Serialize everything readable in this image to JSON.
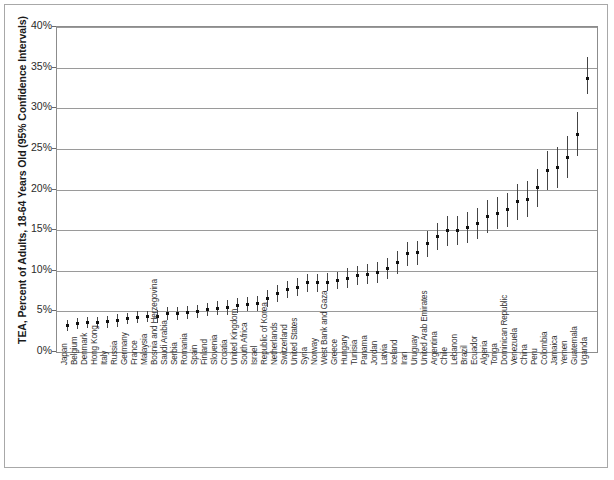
{
  "figure": {
    "axis_title_y": "TEA, Percent of Adults, 18-64 Years Old (95% Confidence Intervals)",
    "frame_color": "#a8a8a8",
    "plot_border_color": "#8c8c8c",
    "grid_color": "#9a9a9a",
    "marker_color": "#111111",
    "ci_color": "#454545"
  },
  "chart_data": {
    "type": "scatter",
    "title": "",
    "subtitle": "",
    "xlabel": "",
    "ylabel": "TEA, Percent of Adults, 18-64 Years Old (95% Confidence Intervals)",
    "ylim": [
      0,
      40
    ],
    "ytick_labels": [
      "0%",
      "5%",
      "10%",
      "15%",
      "20%",
      "25%",
      "30%",
      "35%",
      "40%"
    ],
    "ytick_values": [
      0,
      5,
      10,
      15,
      20,
      25,
      30,
      35,
      40
    ],
    "grid": "horizontal",
    "legend": "none",
    "error_bars": "95% confidence intervals",
    "categories": [
      "Japan",
      "Belgium",
      "Denmark",
      "Hong Kong",
      "Italy",
      "Russia",
      "Germany",
      "France",
      "Malaysia",
      "Bosnia and Herzegovina",
      "Saudi Arabia",
      "Serbia",
      "Romania",
      "Spain",
      "Finland",
      "Slovenia",
      "Croatia",
      "United Kingdom",
      "South Africa",
      "Israel",
      "Republic of Korea",
      "Netherlands",
      "Switzerland",
      "United States",
      "Syria",
      "Norway",
      "West Bank and Gaza",
      "Greece",
      "Hungary",
      "Tunisia",
      "Panama",
      "Jordan",
      "Latvia",
      "Iceland",
      "Iran",
      "Uruguay",
      "United Arab Emirates",
      "Argentina",
      "Chile",
      "Lebanon",
      "Brazil",
      "Ecuador",
      "Algeria",
      "Tonga",
      "Dominican Republic",
      "Venezuela",
      "China",
      "Peru",
      "Colombia",
      "Jamaica",
      "Yemen",
      "Guatemala",
      "Uganda"
    ],
    "values": [
      3.3,
      3.5,
      3.6,
      3.6,
      3.7,
      3.9,
      4.1,
      4.3,
      4.4,
      4.4,
      4.7,
      4.8,
      4.9,
      5.0,
      5.2,
      5.4,
      5.5,
      5.7,
      5.9,
      6.0,
      6.6,
      7.2,
      7.7,
      8.0,
      8.5,
      8.5,
      8.6,
      8.8,
      9.1,
      9.4,
      9.6,
      9.8,
      10.3,
      11.0,
      12.1,
      12.2,
      13.3,
      14.2,
      14.9,
      15.0,
      15.3,
      15.8,
      16.7,
      17.1,
      17.5,
      18.5,
      18.8,
      20.2,
      22.4,
      22.7,
      24.0,
      26.8,
      33.7
    ],
    "ci_lower": [
      2.6,
      2.8,
      2.9,
      2.9,
      3.0,
      3.1,
      3.4,
      3.6,
      3.7,
      3.6,
      3.9,
      4.0,
      4.1,
      4.2,
      4.4,
      4.5,
      4.6,
      4.8,
      5.0,
      5.1,
      5.6,
      6.2,
      6.7,
      6.9,
      7.4,
      7.4,
      7.5,
      7.7,
      7.9,
      8.2,
      8.4,
      8.5,
      9.0,
      9.6,
      10.6,
      10.7,
      11.7,
      12.5,
      13.1,
      13.2,
      13.4,
      13.9,
      14.7,
      15.1,
      15.4,
      16.3,
      16.6,
      17.9,
      20.0,
      20.2,
      21.4,
      24.1,
      31.8
    ],
    "ci_upper": [
      4.0,
      4.2,
      4.3,
      4.3,
      4.4,
      4.7,
      4.8,
      5.0,
      5.1,
      5.2,
      5.5,
      5.6,
      5.7,
      5.8,
      6.0,
      6.3,
      6.4,
      6.6,
      6.8,
      6.9,
      7.6,
      8.2,
      8.7,
      9.1,
      9.6,
      9.6,
      9.7,
      9.9,
      10.3,
      10.6,
      10.8,
      11.1,
      11.6,
      12.4,
      13.6,
      13.7,
      14.9,
      15.9,
      16.7,
      16.8,
      17.2,
      17.7,
      18.7,
      19.1,
      19.6,
      20.7,
      21.0,
      22.5,
      24.8,
      25.2,
      26.6,
      29.5,
      36.3
    ]
  }
}
